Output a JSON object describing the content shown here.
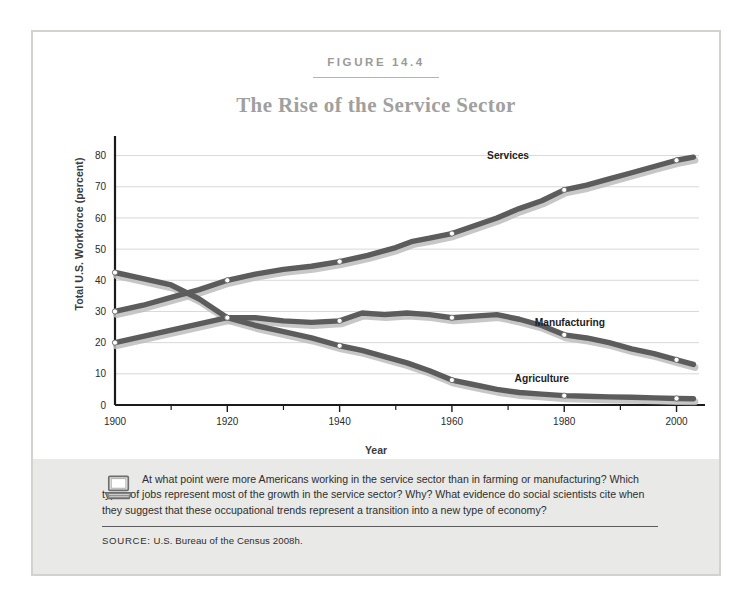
{
  "figure": {
    "number_label": "FIGURE 14.4",
    "title": "The Rise of the Service Sector"
  },
  "caption": {
    "icon": "laptop-icon",
    "question_text": "At what point were more Americans working in the service sector than in farming or manufacturing? Which types of jobs represent most of the growth in the service sector? Why? What evidence do social scientists cite when they suggest that these occupational trends represent a transition into a new type of economy?",
    "source_label": "SOURCE:",
    "source_value": "U.S. Bureau of the Census 2008h."
  },
  "colors": {
    "line": "#5c5c5c",
    "line_shadow": "#bdbdbd",
    "grid": "#d8d8d6",
    "axis": "#1b1b1b",
    "panel_bg": "#e9e9e7",
    "frame_border": "#d2d2cf",
    "title_gray": "#a0a09e"
  },
  "chart_data": {
    "type": "line",
    "title": "The Rise of the Service Sector",
    "xlabel": "Year",
    "ylabel": "Total U.S. Workforce (percent)",
    "xlim": [
      1900,
      2004
    ],
    "ylim": [
      0,
      85
    ],
    "xticks": [
      1900,
      1920,
      1940,
      1960,
      1980,
      2000
    ],
    "xtick_labels": [
      "1900",
      "1920",
      "1940",
      "1960",
      "1980",
      "2000"
    ],
    "yticks": [
      0,
      10,
      20,
      30,
      40,
      50,
      60,
      70,
      80
    ],
    "ytick_labels": [
      "0",
      "10",
      "20",
      "30",
      "40",
      "50",
      "60",
      "70",
      "80"
    ],
    "minor_xticks": [
      1910,
      1930,
      1950,
      1970,
      1990
    ],
    "grid": "horizontal",
    "legend": "inline-labels",
    "marker_years": [
      1900,
      1920,
      1940,
      1960,
      1980,
      2000
    ],
    "series": [
      {
        "name": "Services",
        "label": "Services",
        "label_x": 1970,
        "label_y": 79,
        "x": [
          1900,
          1905,
          1910,
          1915,
          1920,
          1925,
          1930,
          1935,
          1940,
          1945,
          1950,
          1953,
          1956,
          1960,
          1964,
          1968,
          1972,
          1976,
          1980,
          1984,
          1988,
          1992,
          1996,
          2000,
          2003
        ],
        "values": [
          30,
          32,
          34.5,
          37,
          40,
          42,
          43.5,
          44.5,
          46,
          48,
          50.5,
          52.5,
          53.5,
          55,
          57.5,
          60,
          63,
          65.5,
          69,
          70.5,
          72.5,
          74.5,
          76.5,
          78.5,
          79.5
        ]
      },
      {
        "name": "Manufacturing",
        "label": "Manufacturing",
        "label_x": 1981,
        "label_y": 25.5,
        "x": [
          1900,
          1905,
          1910,
          1915,
          1920,
          1925,
          1930,
          1935,
          1940,
          1944,
          1948,
          1952,
          1956,
          1960,
          1964,
          1968,
          1972,
          1976,
          1980,
          1984,
          1988,
          1992,
          1996,
          2000,
          2003
        ],
        "values": [
          20,
          22,
          24,
          26,
          28,
          28,
          27,
          26.5,
          27,
          29.5,
          29,
          29.5,
          29,
          28,
          28.5,
          29,
          27.5,
          25.5,
          22.5,
          21.5,
          20,
          18,
          16.5,
          14.5,
          13
        ]
      },
      {
        "name": "Agriculture",
        "label": "Agriculture",
        "label_x": 1976,
        "label_y": 7.5,
        "x": [
          1900,
          1905,
          1910,
          1915,
          1920,
          1925,
          1930,
          1935,
          1940,
          1944,
          1948,
          1952,
          1956,
          1960,
          1964,
          1968,
          1972,
          1976,
          1980,
          1984,
          1988,
          1992,
          1996,
          2000,
          2003
        ],
        "values": [
          42.5,
          40.5,
          38.5,
          34,
          28,
          25.5,
          23.5,
          21.5,
          19,
          17.5,
          15.5,
          13.5,
          11,
          8,
          6.5,
          5,
          4,
          3.5,
          3,
          2.8,
          2.6,
          2.5,
          2.3,
          2.1,
          2
        ]
      }
    ]
  }
}
